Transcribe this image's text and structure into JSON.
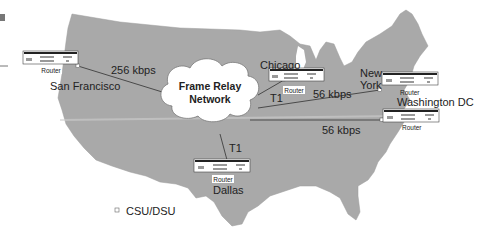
{
  "diagram": {
    "cloud": {
      "line1": "Frame Relay",
      "line2": "Network"
    },
    "sites": [
      {
        "city": "San Francisco",
        "device": "Router",
        "link": "256 kbps"
      },
      {
        "city": "Chicago",
        "device": "Router",
        "link": "T1"
      },
      {
        "city": "New York",
        "city_line1": "New",
        "city_line2": "York",
        "device": "Router",
        "link": "56 kbps"
      },
      {
        "city": "Washington DC",
        "device": "Router",
        "link": "56 kbps"
      },
      {
        "city": "Dallas",
        "device": "Router",
        "link": "T1"
      }
    ],
    "legend": {
      "symbol": "small-square",
      "label": "CSU/DSU"
    },
    "colors": {
      "map_fill": "#a9a9a9",
      "line": "#4a4a4a",
      "cloud_fill": "#ffffff",
      "background": "#ffffff"
    }
  }
}
